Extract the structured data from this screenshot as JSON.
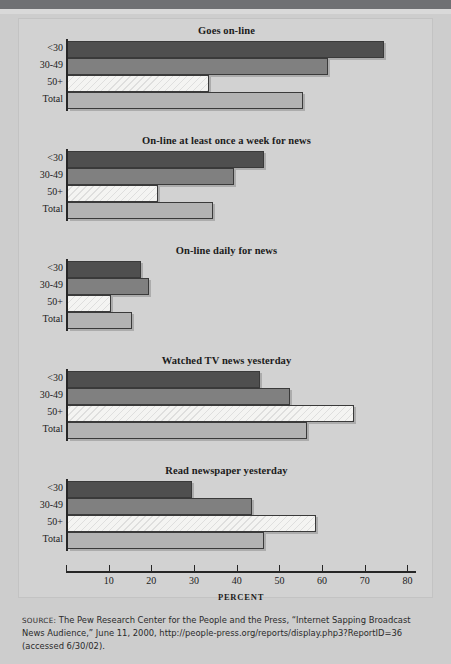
{
  "figure": {
    "x_axis_title": "PERCENT",
    "categories": [
      "<30",
      "30-49",
      "50+",
      "Total"
    ],
    "ticks": [
      0,
      10,
      20,
      30,
      40,
      50,
      60,
      70,
      80
    ],
    "tick_labels": [
      "",
      "10",
      "20",
      "30",
      "40",
      "50",
      "60",
      "70",
      "80"
    ],
    "source_label": "SOURCE:",
    "source_text": " The Pew Research Center for the People and the Press, “Internet Sapping Broadcast News Audience,” June 11, 2000, http://people-press.org/reports/display.php3?ReportID=36 (accessed 6/30/02)."
  },
  "colors": {
    "under30": "#4f4f4f",
    "age30to49": "#808080",
    "age50plus": "#f4f4f2",
    "total": "#b3b3b3",
    "axis": "#262626",
    "panel_bg": "#d2d2d2",
    "page_bg": "#cdcdcd",
    "band": "#6f7073"
  },
  "chart_data": [
    {
      "type": "bar",
      "title": "Goes on-line",
      "orientation": "horizontal",
      "categories": [
        "<30",
        "30-49",
        "50+",
        "Total"
      ],
      "values": [
        74,
        61,
        33,
        55
      ],
      "xlabel": "PERCENT",
      "ylabel": "",
      "xlim": [
        0,
        82
      ],
      "grid": false,
      "legend": "none"
    },
    {
      "type": "bar",
      "title": "On-line at least once a week for news",
      "orientation": "horizontal",
      "categories": [
        "<30",
        "30-49",
        "50+",
        "Total"
      ],
      "values": [
        46,
        39,
        21,
        34
      ],
      "xlabel": "PERCENT",
      "ylabel": "",
      "xlim": [
        0,
        82
      ],
      "grid": false,
      "legend": "none"
    },
    {
      "type": "bar",
      "title": "On-line daily for news",
      "orientation": "horizontal",
      "categories": [
        "<30",
        "30-49",
        "50+",
        "Total"
      ],
      "values": [
        17,
        19,
        10,
        15
      ],
      "xlabel": "PERCENT",
      "ylabel": "",
      "xlim": [
        0,
        82
      ],
      "grid": false,
      "legend": "none"
    },
    {
      "type": "bar",
      "title": "Watched TV news yesterday",
      "orientation": "horizontal",
      "categories": [
        "<30",
        "30-49",
        "50+",
        "Total"
      ],
      "values": [
        45,
        52,
        67,
        56
      ],
      "xlabel": "PERCENT",
      "ylabel": "",
      "xlim": [
        0,
        82
      ],
      "grid": false,
      "legend": "none"
    },
    {
      "type": "bar",
      "title": "Read newspaper yesterday",
      "orientation": "horizontal",
      "categories": [
        "<30",
        "30-49",
        "50+",
        "Total"
      ],
      "values": [
        29,
        43,
        58,
        46
      ],
      "xlabel": "PERCENT",
      "ylabel": "",
      "xlim": [
        0,
        82
      ],
      "grid": false,
      "legend": "none"
    }
  ]
}
